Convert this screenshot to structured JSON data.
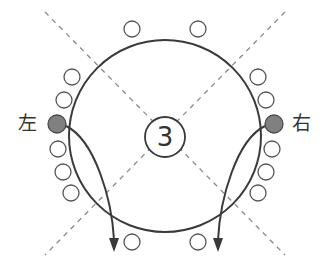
{
  "diagram": {
    "center_number": "3",
    "left_label": "左",
    "right_label": "右",
    "colors": {
      "stroke": "#3a3a3a",
      "dashed": "#8a8a8a",
      "filled_dot": "#808080",
      "background": "#ffffff"
    },
    "main_circle": {
      "cx": 165,
      "cy": 136,
      "r": 96
    },
    "center_circle": {
      "cx": 165,
      "cy": 137,
      "r": 20
    },
    "dashed_lines": [
      {
        "x1": 45,
        "y1": 12,
        "x2": 285,
        "y2": 255
      },
      {
        "x1": 285,
        "y1": 12,
        "x2": 45,
        "y2": 255
      }
    ],
    "seats": {
      "top": [
        {
          "cx": 132,
          "cy": 29
        },
        {
          "cx": 198,
          "cy": 29
        }
      ],
      "bottom": [
        {
          "cx": 132,
          "cy": 242
        },
        {
          "cx": 198,
          "cy": 242
        }
      ],
      "left": [
        {
          "cx": 72,
          "cy": 77
        },
        {
          "cx": 64,
          "cy": 100
        },
        {
          "cx": 58,
          "cy": 149
        },
        {
          "cx": 63,
          "cy": 172
        },
        {
          "cx": 71,
          "cy": 193
        }
      ],
      "right": [
        {
          "cx": 258,
          "cy": 77
        },
        {
          "cx": 266,
          "cy": 100
        },
        {
          "cx": 272,
          "cy": 149
        },
        {
          "cx": 266,
          "cy": 172
        },
        {
          "cx": 258,
          "cy": 193
        }
      ],
      "highlighted": [
        {
          "side": "left",
          "cx": 57,
          "cy": 124
        },
        {
          "side": "right",
          "cx": 274,
          "cy": 124
        }
      ]
    },
    "arrows": [
      {
        "side": "left",
        "from": [
          66,
          126
        ],
        "to": [
          114,
          252
        ]
      },
      {
        "side": "right",
        "from": [
          265,
          126
        ],
        "to": [
          218,
          252
        ]
      }
    ]
  }
}
